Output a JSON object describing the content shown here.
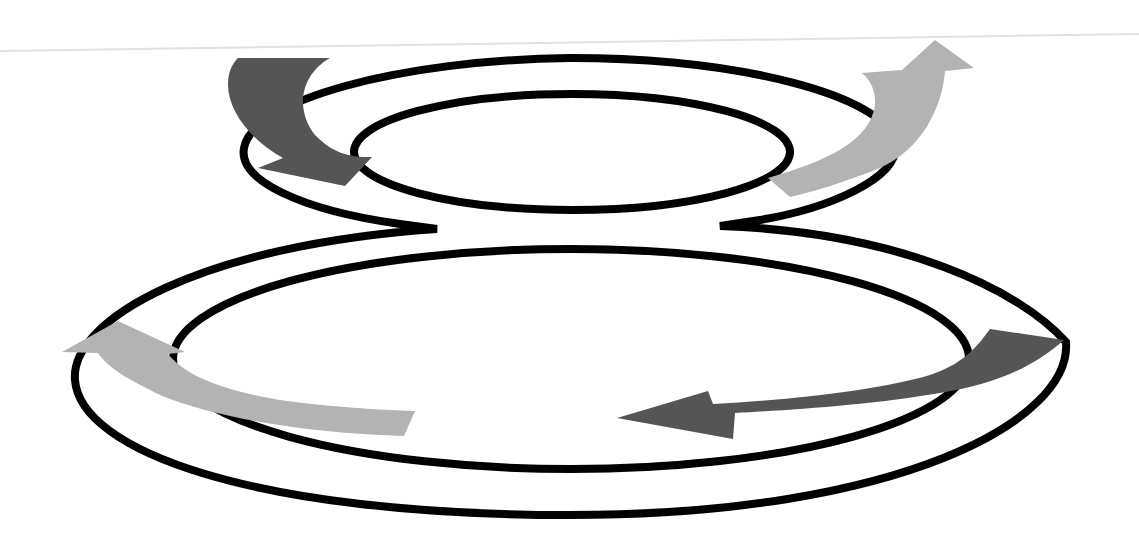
{
  "diagram": {
    "type": "figure-eight-cycle",
    "background": "#ffffff",
    "colors": {
      "ring_stroke": "#000000",
      "arrow_dark": "#555555",
      "arrow_light": "#b3b3b3",
      "guide_line": "#e0e0e0"
    },
    "rings": [
      {
        "name": "upper-inner-loop"
      },
      {
        "name": "upper-outer-loop"
      },
      {
        "name": "lower-inner-loop"
      },
      {
        "name": "lower-outer-loop"
      }
    ],
    "arrows": [
      {
        "name": "arrow-upper-left",
        "shade": "dark",
        "direction": "down-right"
      },
      {
        "name": "arrow-upper-right",
        "shade": "light",
        "direction": "up"
      },
      {
        "name": "arrow-lower-left",
        "shade": "light",
        "direction": "up-left"
      },
      {
        "name": "arrow-lower-right",
        "shade": "dark",
        "direction": "left"
      }
    ]
  }
}
